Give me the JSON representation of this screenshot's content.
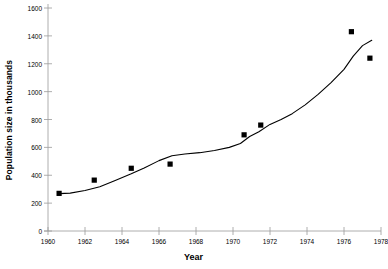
{
  "chart_data": {
    "type": "scatter",
    "title": "",
    "xlabel": "Year",
    "ylabel": "Population size in thousands",
    "xlim": [
      1960,
      1978
    ],
    "ylim": [
      0,
      1600
    ],
    "xticks": [
      1960,
      1962,
      1964,
      1966,
      1968,
      1970,
      1972,
      1974,
      1976,
      1978
    ],
    "yticks": [
      0,
      200,
      400,
      600,
      800,
      1000,
      1200,
      1400,
      1600
    ],
    "grid": false,
    "legend": null,
    "series": [
      {
        "name": "Population observations",
        "marker": "square",
        "color": "#000000",
        "points": [
          {
            "x": 1960.6,
            "y": 270
          },
          {
            "x": 1962.5,
            "y": 365
          },
          {
            "x": 1964.5,
            "y": 450
          },
          {
            "x": 1966.6,
            "y": 480
          },
          {
            "x": 1970.6,
            "y": 690
          },
          {
            "x": 1971.5,
            "y": 760
          },
          {
            "x": 1976.4,
            "y": 1430
          },
          {
            "x": 1977.4,
            "y": 1240
          }
        ]
      },
      {
        "name": "Trend curve",
        "marker": "none",
        "color": "#000000",
        "points": [
          {
            "x": 1960.6,
            "y": 268
          },
          {
            "x": 1961.2,
            "y": 272
          },
          {
            "x": 1962.0,
            "y": 290
          },
          {
            "x": 1962.8,
            "y": 318
          },
          {
            "x": 1963.6,
            "y": 360
          },
          {
            "x": 1964.5,
            "y": 410
          },
          {
            "x": 1965.2,
            "y": 452
          },
          {
            "x": 1966.0,
            "y": 505
          },
          {
            "x": 1966.7,
            "y": 540
          },
          {
            "x": 1967.4,
            "y": 552
          },
          {
            "x": 1968.2,
            "y": 562
          },
          {
            "x": 1969.0,
            "y": 578
          },
          {
            "x": 1969.8,
            "y": 600
          },
          {
            "x": 1970.4,
            "y": 628
          },
          {
            "x": 1970.9,
            "y": 678
          },
          {
            "x": 1971.4,
            "y": 712
          },
          {
            "x": 1972.0,
            "y": 765
          },
          {
            "x": 1972.6,
            "y": 800
          },
          {
            "x": 1973.2,
            "y": 842
          },
          {
            "x": 1973.9,
            "y": 905
          },
          {
            "x": 1974.6,
            "y": 980
          },
          {
            "x": 1975.3,
            "y": 1065
          },
          {
            "x": 1976.0,
            "y": 1160
          },
          {
            "x": 1976.5,
            "y": 1255
          },
          {
            "x": 1977.0,
            "y": 1330
          },
          {
            "x": 1977.5,
            "y": 1368
          }
        ]
      }
    ]
  },
  "axis": {
    "y_tick_labels": [
      "1600",
      "1400",
      "1200",
      "1000",
      "800",
      "600",
      "400",
      "200",
      "0"
    ],
    "x_tick_labels": [
      "1960",
      "1962",
      "1964",
      "1966",
      "1968",
      "1970",
      "1972",
      "1974",
      "1976",
      "1978"
    ]
  }
}
